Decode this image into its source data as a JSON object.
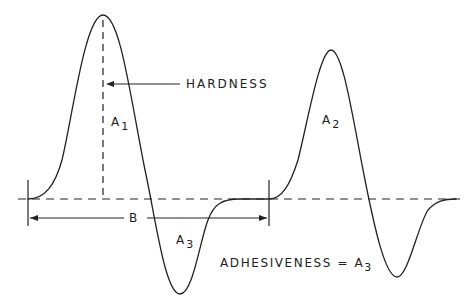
{
  "diagram": {
    "type": "texture-profile-analysis-curve",
    "labels": {
      "hardness": "HARDNESS",
      "area1_main": "A",
      "area1_sub": "1",
      "area2_main": "A",
      "area2_sub": "2",
      "area3_main": "A",
      "area3_sub": "3",
      "b_label": "B",
      "adhesiveness_main": "ADHESIVENESS = A",
      "adhesiveness_sub": "3"
    },
    "colors": {
      "line": "#222222",
      "background": "#ffffff"
    }
  }
}
